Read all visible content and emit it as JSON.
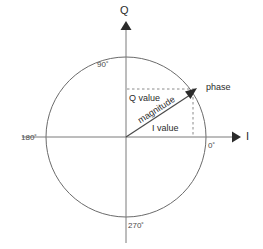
{
  "diagram": {
    "axes": {
      "vertical_label": "Q",
      "horizontal_label": "I"
    },
    "angle_marks": [
      {
        "name": "ninety",
        "label": "90˚"
      },
      {
        "name": "zero",
        "label": "0˚"
      },
      {
        "name": "one-eighty",
        "label": "180˚"
      },
      {
        "name": "two-seventy",
        "label": "270˚"
      }
    ],
    "annotations": [
      {
        "name": "q-value",
        "label": "Q value"
      },
      {
        "name": "i-value",
        "label": "I value"
      },
      {
        "name": "magnitude",
        "label": "magnitude"
      },
      {
        "name": "phase",
        "label": "phase"
      }
    ],
    "colors": {
      "background": "#ffffff",
      "stroke": "#6b6b6b",
      "axis": "#7a7a7a",
      "vector": "#4a4a4a",
      "dashed": "#8a8a8a",
      "text": "#2b2b2b"
    },
    "geometry": {
      "center_x": 126,
      "center_y": 137,
      "radius": 80,
      "vector_tip_x": 195,
      "vector_tip_y": 90
    }
  }
}
